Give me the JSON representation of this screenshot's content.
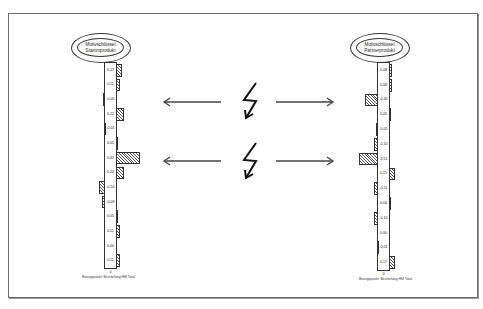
{
  "diagram": {
    "left_panel": {
      "title_line1": "Motivschlüssel",
      "title_line2": "Stammprodukt",
      "values": [
        "0.17",
        "0.11",
        "-0.05",
        "0.22",
        "-0.01",
        "0.05",
        "0.63",
        "0.20",
        "-0.16",
        "-0.09",
        "0.05",
        "0.11",
        "0.00",
        "0.11"
      ],
      "bars": [
        0.17,
        0.11,
        -0.05,
        0.22,
        -0.01,
        0.05,
        0.63,
        0.2,
        -0.16,
        -0.09,
        0.05,
        0.11,
        0.0,
        0.11
      ],
      "zero_label": "0",
      "footer": "Bezugspunkt: Beurteilung HM Total"
    },
    "right_panel": {
      "title_line1": "Motivschlüssel",
      "title_line2": "Partnerprodukt",
      "values": [
        "0.08",
        "0.08",
        "-0.34",
        "0.05",
        "-0.05",
        "-0.10",
        "-0.51",
        "0.15",
        "-0.11",
        "0.04",
        "-0.10",
        "0.00",
        "-0.01",
        "0.17"
      ],
      "bars": [
        0.08,
        0.08,
        -0.34,
        0.05,
        -0.05,
        -0.1,
        -0.51,
        0.15,
        -0.11,
        0.04,
        -0.1,
        0.0,
        -0.01,
        0.17
      ],
      "zero_label": "0",
      "footer": "Bezugspunkt: Beurteilung HM Total"
    },
    "connectors": [
      {
        "name": "upper-conflict",
        "icon": "lightning-icon",
        "arrows": [
          "left-arrow",
          "right-arrow"
        ]
      },
      {
        "name": "lower-conflict",
        "icon": "lightning-icon",
        "arrows": [
          "left-arrow",
          "right-arrow"
        ]
      }
    ]
  }
}
